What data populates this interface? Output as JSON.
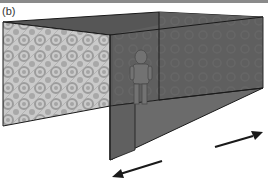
{
  "figure": {
    "panel_label": "(b)"
  },
  "colors": {
    "patterned_wall_base": "#c8c8c8",
    "patterned_wall_motif": "#9a9a9a",
    "dark_wall": "#5e5e5e",
    "ceiling": "#575757",
    "floor": "#6a6a6a",
    "edge": "#1a1a1a",
    "arrow": "#1a1a1a",
    "figure": "#707070"
  },
  "arrows": [
    {
      "name": "left-arrow",
      "direction": "toward viewer-left"
    },
    {
      "name": "right-arrow",
      "direction": "toward back-right"
    }
  ]
}
